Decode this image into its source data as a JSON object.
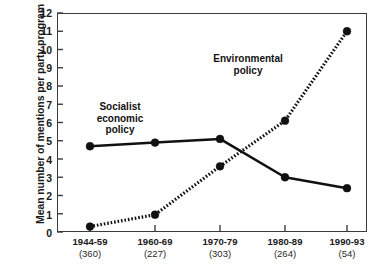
{
  "axes": {
    "ylabel": "Mean number of mentions per party program",
    "yticks": [
      "12",
      "11",
      "10",
      "9",
      "8",
      "7",
      "6",
      "5",
      "4",
      "3",
      "2",
      "1",
      "0"
    ],
    "xticks": [
      {
        "period": "1944-59",
        "count": "(360)"
      },
      {
        "period": "1960-69",
        "count": "(227)"
      },
      {
        "period": "1970-79",
        "count": "(303)"
      },
      {
        "period": "1980-89",
        "count": "(264)"
      },
      {
        "period": "1990-93",
        "count": "(54)"
      }
    ]
  },
  "annotations": {
    "socialist": "Socialist\neconomic\npolicy",
    "socialist_line1": "Socialist",
    "socialist_line2": "economic",
    "socialist_line3": "policy",
    "environmental_line1": "Environmental",
    "environmental_line2": "policy"
  },
  "colors": {
    "line": "#111111",
    "frame": "#3b3b3b",
    "marker": "#111111",
    "background": "#ffffff"
  },
  "chart_data": {
    "type": "line",
    "title": "",
    "xlabel": "",
    "ylabel": "Mean number of mentions per party program",
    "categories": [
      "1944-59",
      "1960-69",
      "1970-79",
      "1980-89",
      "1990-93"
    ],
    "category_counts": [
      360,
      227,
      303,
      264,
      54
    ],
    "ylim": [
      0,
      12
    ],
    "yticks": [
      0,
      1,
      2,
      3,
      4,
      5,
      6,
      7,
      8,
      9,
      10,
      11,
      12
    ],
    "grid": false,
    "legend": "inline-annotations",
    "series": [
      {
        "name": "Socialist economic policy",
        "style": "solid",
        "marker": "filled-circle",
        "values": [
          4.7,
          4.9,
          5.1,
          3.0,
          2.4
        ]
      },
      {
        "name": "Environmental policy",
        "style": "dotted",
        "marker": "filled-circle",
        "values": [
          0.3,
          0.95,
          3.6,
          6.1,
          11.0
        ]
      }
    ]
  }
}
